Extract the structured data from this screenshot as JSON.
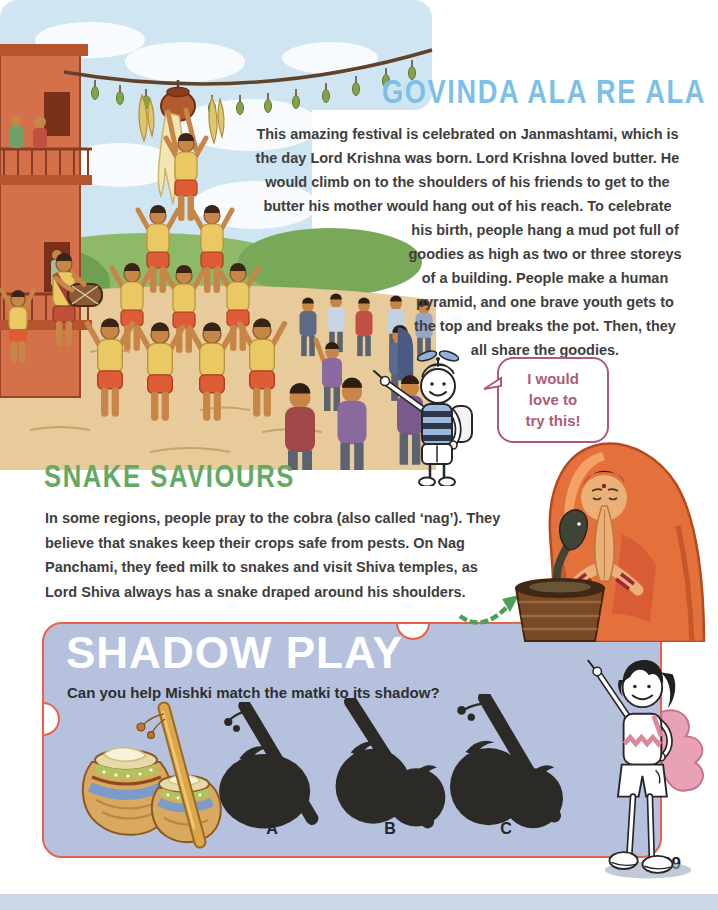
{
  "page": {
    "number": "29"
  },
  "colors": {
    "govinda_title": "#7cc0e8",
    "snake_title": "#64a963",
    "bubble_accent": "#b05a78",
    "shadow_box_bg": "#b6c2dd",
    "shadow_box_border": "#e8614d",
    "shadow_silhouette": "#2b2a26",
    "body_text": "#3f3e3e"
  },
  "govinda": {
    "title": "GOVINDA ALA RE ALA",
    "para_wide": [
      "This amazing festival is celebrated on Janmashtami, which is",
      "the day Lord Krishna was born. Lord Krishna loved butter. He",
      "would climb on to the shoulders of his friends to get to the",
      "butter his mother would hang out of his reach. To celebrate"
    ],
    "para_narrow": [
      "his birth, people hang a mud pot full of",
      "goodies as high as two or three storeys",
      "of a building. People make a human",
      "pyramid, and one brave youth gets to",
      "the top and breaks the pot. Then, they",
      "all share the goodies."
    ]
  },
  "bubble": {
    "lines": [
      "I would",
      "love to",
      "try this!"
    ]
  },
  "snake": {
    "title": "SNAKE SAVIOURS",
    "para": [
      "In some regions, people pray to the cobra (also called ‘nag’). They",
      "believe that snakes keep their crops safe from pests. On Nag",
      "Panchami, they feed milk to snakes and visit Shiva temples, as",
      "Lord Shiva always has a snake draped around his shoulders."
    ]
  },
  "shadow_play": {
    "title": "SHADOW PLAY",
    "question": "Can you help Mishki match the matki to its shadow?",
    "options": [
      {
        "label": "A"
      },
      {
        "label": "B"
      },
      {
        "label": "C"
      }
    ]
  },
  "illustrations": {
    "pyramid_scene": "dahi-handi-human-pyramid",
    "mascot_boy": "propeller-cap-boy-pointing",
    "praying_woman": "woman-praying-to-cobra",
    "matki": "decorated-matki-pots-with-stick",
    "mishki_girl": "mishki-pointing-girl"
  }
}
